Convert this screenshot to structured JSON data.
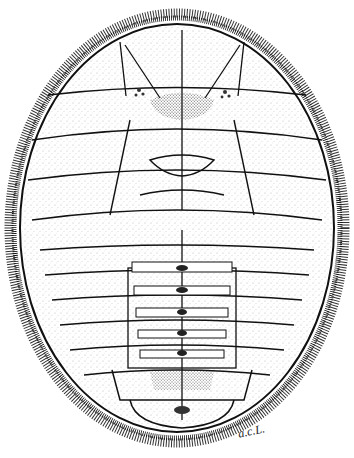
{
  "image": {
    "subject": "stippled ink scientific illustration of an oval, flattened insect nymph/larva (scale-insect-like) with fringed margin and segmented body",
    "style": "black ink stipple and line on white",
    "colors": {
      "background": "#ffffff",
      "ink": "#1a1a1a",
      "stipple": "#555555"
    }
  },
  "signature": {
    "text": "a.c.L."
  }
}
